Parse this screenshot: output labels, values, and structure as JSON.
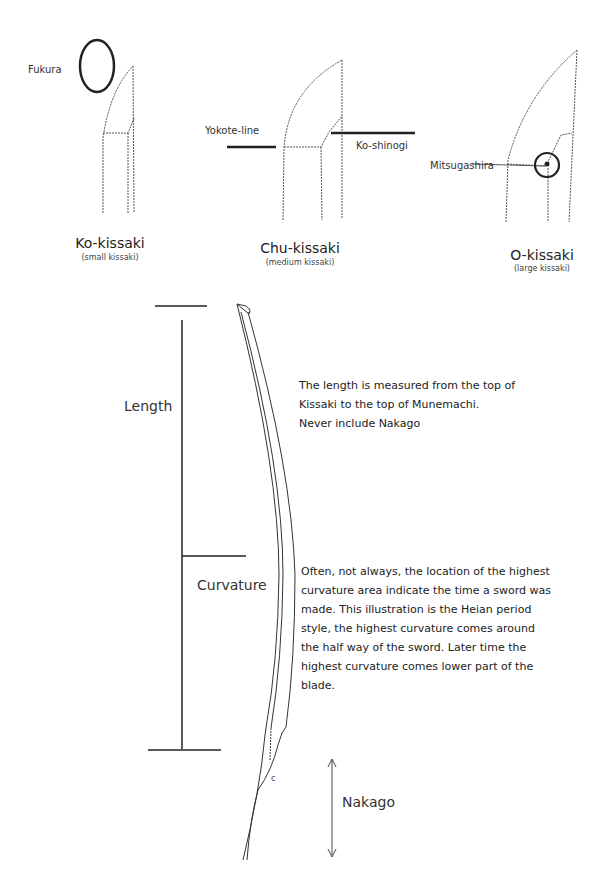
{
  "kissaki_types": [
    {
      "name": "Ko-kissaki",
      "subtitle": "(small kissaki)",
      "callout": "Fukura"
    },
    {
      "name": "Chu-kissaki",
      "subtitle": "(medium kissaki)",
      "callouts": [
        "Yokote-line",
        "Ko-shinogi"
      ]
    },
    {
      "name": "O-kissaki",
      "subtitle": "(large kissaki)",
      "callout": "Mitsugashira"
    }
  ],
  "sword": {
    "length_label": "Length",
    "curvature_label": "Curvature",
    "nakago_label": "Nakago",
    "mekugi_mark": "c"
  },
  "notes": {
    "length_note": [
      "The length is measured from the top of",
      "Kissaki to the top of Munemachi.",
      "Never include Nakago"
    ],
    "curvature_note": [
      "Often, not always, the location of the highest",
      "curvature area indicate the time a sword was",
      "made.  This illustration is the Heian period",
      "style, the highest curvature comes around",
      "the half way of the sword.  Later time the",
      "highest curvature comes lower part of the",
      "blade."
    ]
  }
}
